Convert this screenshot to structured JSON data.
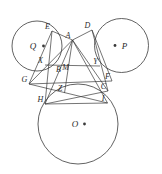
{
  "figure": {
    "background_color": "#ffffff",
    "stroke_color": "#3a3a3a",
    "label_color": "#2a2a2a",
    "width": 162,
    "height": 174
  },
  "circles": [
    {
      "name": "circle-Q",
      "center_label": "Q",
      "cx": 37.0,
      "cy": 46.0,
      "r": 25.0,
      "dot": {
        "x": 43.5,
        "y": 46.0
      },
      "label_pos": {
        "x": 33.0,
        "y": 46.0
      }
    },
    {
      "name": "circle-P",
      "center_label": "P",
      "cx": 121.5,
      "cy": 45.5,
      "r": 27.0,
      "dot": {
        "x": 115.0,
        "y": 45.5
      },
      "label_pos": {
        "x": 124.5,
        "y": 45.5
      }
    },
    {
      "name": "circle-O",
      "center_label": "O",
      "cx": 78.0,
      "cy": 124.0,
      "r": 40.0,
      "dot": {
        "x": 84.5,
        "y": 124.0
      },
      "label_pos": {
        "x": 75.0,
        "y": 124.0
      }
    }
  ],
  "points": [
    {
      "label": "E",
      "x": 52.0,
      "y": 31.0
    },
    {
      "label": "A",
      "x": 72.5,
      "y": 40.0
    },
    {
      "label": "D",
      "x": 92.0,
      "y": 30.0
    },
    {
      "label": "X",
      "x": 45.0,
      "y": 65.0
    },
    {
      "label": "M",
      "x": 70.0,
      "y": 72.0
    },
    {
      "label": "Y",
      "x": 100.0,
      "y": 66.0
    },
    {
      "label": "B",
      "x": 63.0,
      "y": 74.0
    },
    {
      "label": "G",
      "x": 29.0,
      "y": 84.0
    },
    {
      "label": "Z",
      "x": 64.5,
      "y": 93.0
    },
    {
      "label": "F",
      "x": 112.0,
      "y": 81.0
    },
    {
      "label": "C",
      "x": 108.0,
      "y": 91.0
    },
    {
      "label": "H",
      "x": 45.0,
      "y": 104.0
    },
    {
      "label": "I",
      "x": 107.5,
      "y": 103.0
    }
  ],
  "segments": [
    {
      "name": "segment-E-H",
      "from": "E",
      "to": "H"
    },
    {
      "name": "segment-E-A",
      "from": "E",
      "to": "A"
    },
    {
      "name": "segment-D-C",
      "from": "D",
      "to": "C"
    },
    {
      "name": "segment-D-A",
      "from": "D",
      "to": "A"
    },
    {
      "name": "segment-A-Z",
      "from": "A",
      "to": "Z"
    },
    {
      "name": "segment-A-G",
      "from": "A",
      "to": "G"
    },
    {
      "name": "segment-A-C",
      "from": "A",
      "to": "C"
    },
    {
      "name": "segment-A-H",
      "from": "A",
      "to": "H"
    },
    {
      "name": "segment-A-I",
      "from": "A",
      "to": "I"
    },
    {
      "name": "segment-X-Y",
      "from": "X",
      "to": "Y"
    },
    {
      "name": "segment-G-F",
      "from": "G",
      "to": "F"
    },
    {
      "name": "segment-E-G",
      "from": "E",
      "to": "G"
    },
    {
      "name": "segment-D-F",
      "from": "D",
      "to": "F"
    },
    {
      "name": "segment-H-I",
      "from": "H",
      "to": "I"
    },
    {
      "name": "segment-G-I",
      "from": "G",
      "to": "I"
    },
    {
      "name": "segment-H-C",
      "from": "H",
      "to": "C"
    }
  ]
}
